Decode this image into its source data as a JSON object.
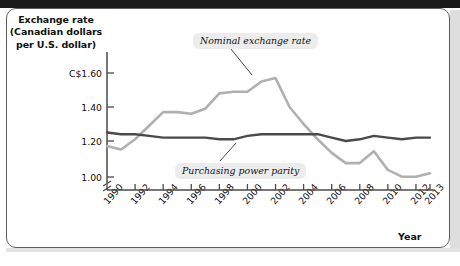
{
  "figure": {
    "y_axis_title": "Exchange rate (Canadian dollars per U.S. dollar)",
    "y_axis_title_lines": [
      "Exchange rate",
      "(Canadian dollars",
      "per U.S. dollar)"
    ],
    "x_axis_title": "Year",
    "axis_break_marker": "broken-axis-slash"
  },
  "callouts": {
    "nominal": "Nominal exchange rate",
    "ppp": "Purchasing power parity"
  },
  "colors": {
    "nominal_line": "#b0b0b0",
    "ppp_line": "#4a4a4a",
    "axis": "#4a4a4a",
    "callout_background": "#ececec",
    "text": "#111111",
    "frame_border": "#5d5d5d"
  },
  "chart_data": {
    "type": "line",
    "title": "",
    "subtitle": "",
    "xlabel": "Year",
    "ylabel": "Exchange rate (Canadian dollars per U.S. dollar)",
    "xlim": [
      1990,
      2013
    ],
    "ylim": [
      0.95,
      1.68
    ],
    "grid": false,
    "legend_position": "inline-annotations",
    "y_ticks": [
      1.0,
      1.2,
      1.4,
      1.6
    ],
    "y_tick_labels": [
      "1.00",
      "1.20",
      "1.40",
      "C$1.60"
    ],
    "x_ticks": [
      1990,
      1992,
      1994,
      1996,
      1998,
      2000,
      2002,
      2004,
      2006,
      2008,
      2010,
      2012,
      2013
    ],
    "x_tick_labels": [
      "1990",
      "1992",
      "1994",
      "1996",
      "1998",
      "2000",
      "2002",
      "2004",
      "2006",
      "2008",
      "2010",
      "2012",
      "2013"
    ],
    "x": [
      1990,
      1991,
      1992,
      1993,
      1994,
      1995,
      1996,
      1997,
      1998,
      1999,
      2000,
      2001,
      2002,
      2003,
      2004,
      2005,
      2006,
      2007,
      2008,
      2009,
      2010,
      2011,
      2012,
      2013
    ],
    "series": [
      {
        "name": "Nominal exchange rate",
        "color": "#b0b0b0",
        "values": [
          1.17,
          1.15,
          1.21,
          1.29,
          1.37,
          1.37,
          1.36,
          1.39,
          1.48,
          1.49,
          1.49,
          1.55,
          1.57,
          1.4,
          1.3,
          1.21,
          1.13,
          1.07,
          1.07,
          1.14,
          1.03,
          0.99,
          0.99,
          1.01
        ]
      },
      {
        "name": "Purchasing power parity",
        "color": "#4a4a4a",
        "values": [
          1.25,
          1.24,
          1.24,
          1.23,
          1.22,
          1.22,
          1.22,
          1.22,
          1.21,
          1.21,
          1.23,
          1.24,
          1.24,
          1.24,
          1.24,
          1.24,
          1.22,
          1.2,
          1.21,
          1.23,
          1.22,
          1.21,
          1.22,
          1.22
        ]
      }
    ]
  }
}
